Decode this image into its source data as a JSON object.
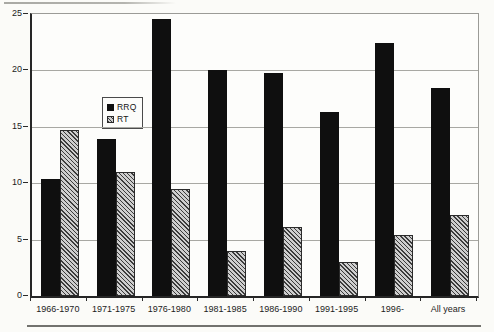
{
  "figure": {
    "background": "#fbfbf8",
    "axis_color": "#262626",
    "gridline_color": "#a8a8a3"
  },
  "chart_data": {
    "type": "bar",
    "title": "",
    "xlabel": "",
    "ylabel": "",
    "categories": [
      "1966-1970",
      "1971-1975",
      "1976-1980",
      "1981-1985",
      "1986-1990",
      "1991-1995",
      "1996-",
      "All years"
    ],
    "series": [
      {
        "name": "RRQ",
        "style": "solid",
        "color": "#0f0f0f",
        "values": [
          10.4,
          13.9,
          24.6,
          20.0,
          19.8,
          16.3,
          22.4,
          18.4
        ]
      },
      {
        "name": "RT",
        "style": "diagonal-hatch",
        "hatch_color": "#3c3c3c",
        "fill_color": "#cecece",
        "values": [
          14.7,
          11.0,
          9.5,
          4.0,
          6.1,
          3.0,
          5.4,
          7.2
        ]
      }
    ],
    "ylim": [
      0,
      25
    ],
    "yticks": [
      0,
      5,
      10,
      15,
      20,
      25
    ],
    "grid": true,
    "legend_position": "inside-upper-left"
  },
  "legend": {
    "items": [
      {
        "label": "RRQ"
      },
      {
        "label": "RT"
      }
    ]
  }
}
